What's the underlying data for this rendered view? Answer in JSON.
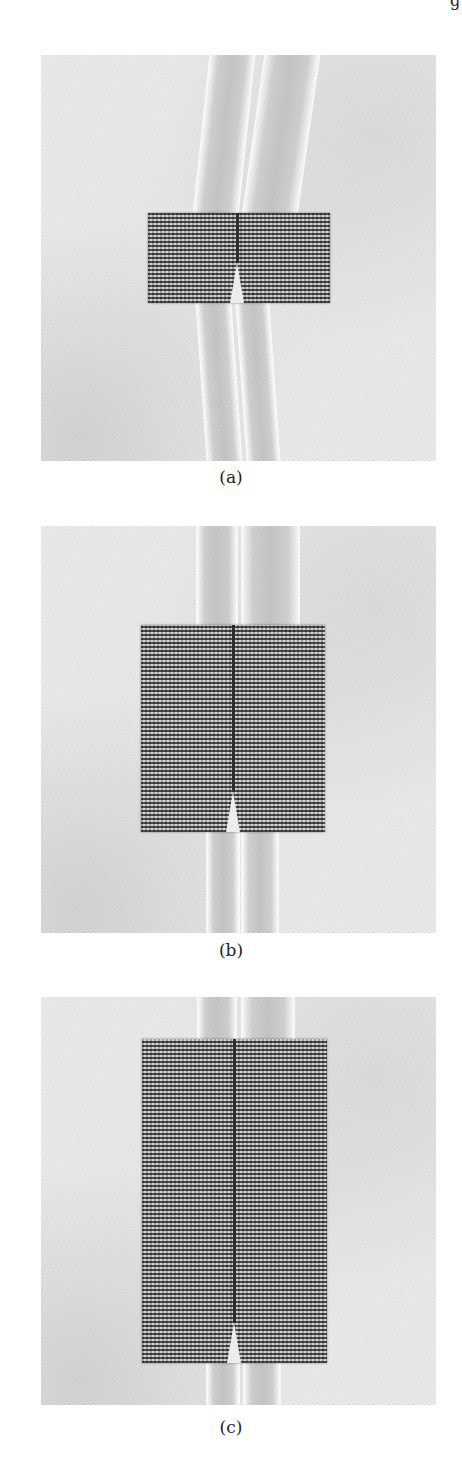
{
  "page": {
    "corner_glyph": "g"
  },
  "figure": {
    "panels": [
      {
        "id": "a",
        "caption": "(a)"
      },
      {
        "id": "b",
        "caption": "(b)"
      },
      {
        "id": "c",
        "caption": "(c)"
      }
    ]
  },
  "colors": {
    "background": "#ffffff",
    "substrate": "#e9e9e9",
    "mesh_dark": "#3a3a3a",
    "trace": "#c4c4c4"
  }
}
